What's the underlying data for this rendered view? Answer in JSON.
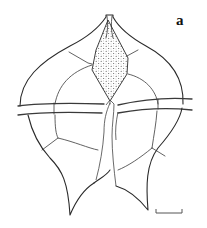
{
  "figure": {
    "panel_label": "a",
    "parts": [
      "apical-horn",
      "stippled-rhomboid-plate",
      "epitheca-plates",
      "cingulum-girdle",
      "sulcus",
      "hypotheca-plates",
      "left-antapical-horn",
      "right-antapical-horn"
    ],
    "scale_bar": {
      "label": ""
    },
    "colors": {
      "line": "#2a2a2a",
      "background": "#ffffff",
      "stipple": "#444444"
    }
  }
}
